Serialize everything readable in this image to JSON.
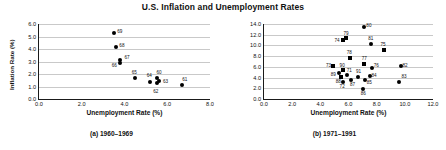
{
  "figure": {
    "title": "U.S. Inflation and Unemployment Rates"
  },
  "chart_data": [
    {
      "type": "scatter",
      "id": "panel-a",
      "title": "(a) 1960-1969",
      "caption": "(a) 1960–1969",
      "xlabel": "Unemployment Rate (%)",
      "ylabel": "Inflation Rate (%)",
      "xlim": [
        0.0,
        8.0
      ],
      "ylim": [
        0.0,
        6.0
      ],
      "xticks": [
        "0.0",
        "2.0",
        "4.0",
        "6.0",
        "8.0"
      ],
      "xtick_values": [
        0.0,
        2.0,
        4.0,
        6.0,
        8.0
      ],
      "yticks": [
        "0.0",
        "1.0",
        "2.0",
        "3.0",
        "4.0",
        "5.0",
        "6.0"
      ],
      "ytick_values": [
        0.0,
        1.0,
        2.0,
        3.0,
        4.0,
        5.0,
        6.0
      ],
      "grid": true,
      "legend": "none",
      "marker": "circle",
      "points": [
        {
          "label": "60",
          "x": 5.5,
          "y": 1.7,
          "lx": 5.62,
          "ly": 2.08
        },
        {
          "label": "61",
          "x": 6.7,
          "y": 1.15,
          "lx": 6.82,
          "ly": 1.52
        },
        {
          "label": "62",
          "x": 5.5,
          "y": 1.25,
          "lx": 5.46,
          "ly": 0.55
        },
        {
          "label": "63",
          "x": 5.6,
          "y": 1.45,
          "lx": 5.92,
          "ly": 1.33
        },
        {
          "label": "64",
          "x": 5.2,
          "y": 1.4,
          "lx": 5.16,
          "ly": 1.82
        },
        {
          "label": "65",
          "x": 4.5,
          "y": 1.7,
          "lx": 4.46,
          "ly": 2.12
        },
        {
          "label": "66",
          "x": 3.8,
          "y": 2.9,
          "lx": 3.52,
          "ly": 2.62
        },
        {
          "label": "67",
          "x": 3.8,
          "y": 3.1,
          "lx": 4.12,
          "ly": 3.32
        },
        {
          "label": "68",
          "x": 3.6,
          "y": 4.15,
          "lx": 3.88,
          "ly": 4.22
        },
        {
          "label": "69",
          "x": 3.5,
          "y": 5.25,
          "lx": 3.78,
          "ly": 5.35
        }
      ]
    },
    {
      "type": "scatter",
      "id": "panel-b",
      "title": "(b) 1971-1991",
      "caption": "(b) 1971–1991",
      "xlabel": "Unemployment Rate (%)",
      "ylabel": "Inflation Rate (%)",
      "xlim": [
        0.0,
        12.0
      ],
      "ylim": [
        0.0,
        14.0
      ],
      "xticks": [
        "0.0",
        "2.0",
        "4.0",
        "6.0",
        "8.0",
        "10.0",
        "12.0"
      ],
      "xtick_values": [
        0.0,
        2.0,
        4.0,
        6.0,
        8.0,
        10.0,
        12.0
      ],
      "yticks": [
        "0.0",
        "2.0",
        "4.0",
        "6.0",
        "8.0",
        "10.0",
        "12.0",
        "14.0"
      ],
      "ytick_values": [
        0.0,
        2.0,
        4.0,
        6.0,
        8.0,
        10.0,
        12.0,
        14.0
      ],
      "grid": true,
      "legend": "none",
      "marker": "mixed",
      "points": [
        {
          "label": "71",
          "x": 5.9,
          "y": 4.4,
          "marker": "circle",
          "lx": 6.05,
          "ly": 5.25
        },
        {
          "label": "72",
          "x": 5.6,
          "y": 3.2,
          "marker": "circle",
          "lx": 5.55,
          "ly": 2.15
        },
        {
          "label": "73",
          "x": 4.9,
          "y": 6.2,
          "marker": "square",
          "lx": 4.58,
          "ly": 6.22
        },
        {
          "label": "74",
          "x": 5.6,
          "y": 11.0,
          "marker": "square",
          "lx": 5.18,
          "ly": 10.78
        },
        {
          "label": "75",
          "x": 8.5,
          "y": 9.1,
          "marker": "square",
          "lx": 8.45,
          "ly": 10.05
        },
        {
          "label": "76",
          "x": 7.7,
          "y": 5.8,
          "marker": "circle",
          "lx": 7.98,
          "ly": 6.15
        },
        {
          "label": "77",
          "x": 7.1,
          "y": 6.5,
          "marker": "square",
          "lx": 7.12,
          "ly": 7.42
        },
        {
          "label": "78",
          "x": 6.1,
          "y": 7.7,
          "marker": "square",
          "lx": 6.05,
          "ly": 8.62
        },
        {
          "label": "79",
          "x": 5.8,
          "y": 11.3,
          "marker": "square",
          "lx": 5.82,
          "ly": 12.05
        },
        {
          "label": "80",
          "x": 7.1,
          "y": 13.5,
          "marker": "circle",
          "lx": 7.45,
          "ly": 13.62
        },
        {
          "label": "81",
          "x": 7.6,
          "y": 10.3,
          "marker": "circle",
          "lx": 7.58,
          "ly": 11.25
        },
        {
          "label": "82",
          "x": 9.7,
          "y": 6.2,
          "marker": "circle",
          "lx": 10.02,
          "ly": 6.18
        },
        {
          "label": "83",
          "x": 9.6,
          "y": 3.2,
          "marker": "circle",
          "lx": 9.95,
          "ly": 4.12
        },
        {
          "label": "84",
          "x": 7.5,
          "y": 4.3,
          "marker": "circle",
          "lx": 7.82,
          "ly": 4.22
        },
        {
          "label": "85",
          "x": 7.2,
          "y": 3.5,
          "marker": "circle",
          "lx": 7.48,
          "ly": 2.92
        },
        {
          "label": "86",
          "x": 7.0,
          "y": 1.9,
          "marker": "circle",
          "lx": 7.05,
          "ly": 0.95
        },
        {
          "label": "87",
          "x": 6.2,
          "y": 3.6,
          "marker": "circle",
          "lx": 6.28,
          "ly": 2.55
        },
        {
          "label": "88",
          "x": 5.5,
          "y": 4.1,
          "marker": "square",
          "lx": 5.28,
          "ly": 3.22
        },
        {
          "label": "89",
          "x": 5.3,
          "y": 4.8,
          "marker": "circle",
          "lx": 4.92,
          "ly": 4.52
        },
        {
          "label": "90",
          "x": 5.6,
          "y": 5.4,
          "marker": "square",
          "lx": 5.55,
          "ly": 6.12
        },
        {
          "label": "91",
          "x": 6.7,
          "y": 4.2,
          "marker": "circle",
          "lx": 6.72,
          "ly": 5.02
        }
      ]
    }
  ]
}
